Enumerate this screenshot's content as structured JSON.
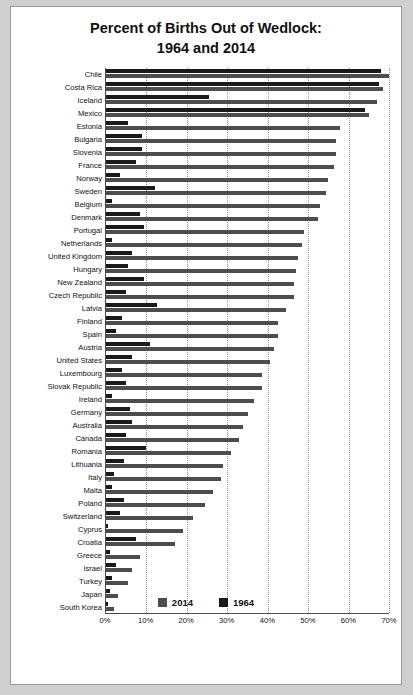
{
  "chart_data": {
    "type": "bar",
    "orientation": "horizontal",
    "title": "Percent of Births Out of Wedlock:\n1964 and 2014",
    "title_line1": "Percent of Births Out of Wedlock:",
    "title_line2": "1964 and 2014",
    "xlabel": "",
    "ylabel": "",
    "xlim": [
      0,
      70
    ],
    "xticks": [
      "0%",
      "10%",
      "20%",
      "30%",
      "40%",
      "50%",
      "60%",
      "70%"
    ],
    "xtick_values": [
      0,
      10,
      20,
      30,
      40,
      50,
      60,
      70
    ],
    "grid": true,
    "legend_position": "bottom",
    "colors": {
      "series_2014": "#4d4d4d",
      "series_1964": "#1a1a1a"
    },
    "categories": [
      "Chile",
      "Costa Rica",
      "Iceland",
      "Mexico",
      "Estonia",
      "Bulgaria",
      "Slovenia",
      "France",
      "Norway",
      "Sweden",
      "Belgium",
      "Denmark",
      "Portugal",
      "Netherlands",
      "United Kingdom",
      "Hungary",
      "New Zealand",
      "Czech Republic",
      "Latvia",
      "Finland",
      "Spain",
      "Austria",
      "United States",
      "Luxembourg",
      "Slovak Republic",
      "Ireland",
      "Germany",
      "Australia",
      "Canada",
      "Romania",
      "Lithuania",
      "Italy",
      "Malta",
      "Poland",
      "Switzerland",
      "Cyprus",
      "Croatia",
      "Greece",
      "Israel",
      "Turkey",
      "Japan",
      "South Korea"
    ],
    "series": [
      {
        "name": "1964",
        "values": [
          68.0,
          67.5,
          25.5,
          64.0,
          5.5,
          9.0,
          9.0,
          7.5,
          3.5,
          12.0,
          1.5,
          8.5,
          9.5,
          1.5,
          6.5,
          5.5,
          9.5,
          5.0,
          12.5,
          4.0,
          2.5,
          11.0,
          6.5,
          4.0,
          5.0,
          1.5,
          6.0,
          6.5,
          5.0,
          10.0,
          4.5,
          2.0,
          1.5,
          4.5,
          3.5,
          0.5,
          7.5,
          1.0,
          2.5,
          1.5,
          1.0,
          0.5
        ]
      },
      {
        "name": "2014",
        "values": [
          70.0,
          68.5,
          67.0,
          65.0,
          58.0,
          57.0,
          57.0,
          56.5,
          55.0,
          54.5,
          53.0,
          52.5,
          49.0,
          48.5,
          47.5,
          47.0,
          46.5,
          46.5,
          44.5,
          42.5,
          42.5,
          41.5,
          40.5,
          38.5,
          38.5,
          36.5,
          35.0,
          34.0,
          33.0,
          31.0,
          29.0,
          28.5,
          26.5,
          24.5,
          21.5,
          19.0,
          17.0,
          8.5,
          6.5,
          5.5,
          3.0,
          2.0
        ]
      }
    ],
    "legend": [
      "2014",
      "1964"
    ]
  }
}
